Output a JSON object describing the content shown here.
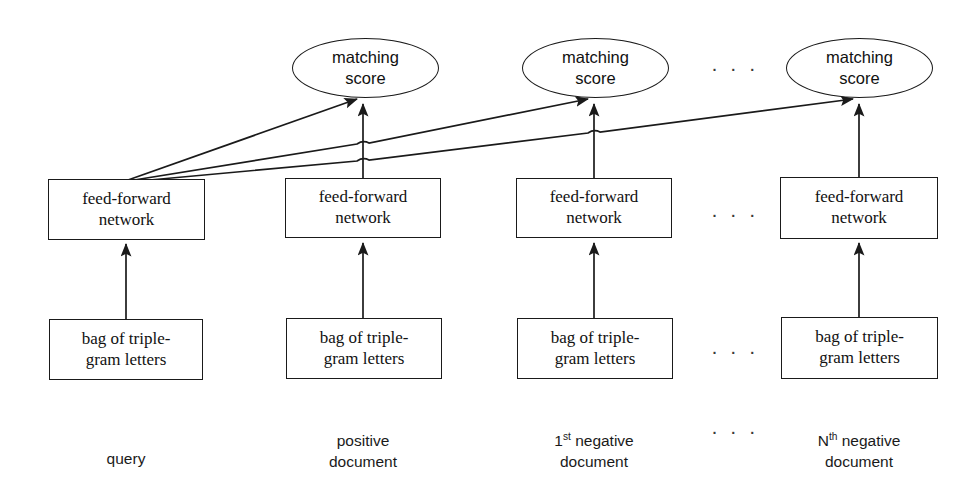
{
  "diagram": {
    "stroke_color": "#1a1a1a",
    "background_color": "#ffffff"
  },
  "score_nodes": [
    {
      "id": "score-query-positive",
      "text": "matching\nscore"
    },
    {
      "id": "score-negative-1",
      "text": "matching\nscore"
    },
    {
      "id": "score-negative-n",
      "text": "matching\nscore"
    }
  ],
  "network_nodes": [
    {
      "id": "ffn-query",
      "text": "feed-forward\nnetwork"
    },
    {
      "id": "ffn-positive",
      "text": "feed-forward\nnetwork"
    },
    {
      "id": "ffn-negative-1",
      "text": "feed-forward\nnetwork"
    },
    {
      "id": "ffn-negative-n",
      "text": "feed-forward\nnetwork"
    }
  ],
  "input_nodes": [
    {
      "id": "bag-query",
      "text": "bag of triple-\ngram letters"
    },
    {
      "id": "bag-positive",
      "text": "bag of triple-\ngram letters"
    },
    {
      "id": "bag-negative-1",
      "text": "bag of triple-\ngram letters"
    },
    {
      "id": "bag-negative-n",
      "text": "bag of triple-\ngram letters"
    }
  ],
  "column_labels": [
    {
      "id": "label-query",
      "text": "query"
    },
    {
      "id": "label-positive",
      "text": "positive\ndocument"
    },
    {
      "id": "label-negative-1",
      "prefix": "1",
      "sup": "st",
      "rest": " negative\ndocument"
    },
    {
      "id": "label-negative-n",
      "prefix": "N",
      "sup": "th",
      "rest": " negative\ndocument"
    }
  ],
  "ellipses_markers": [
    {
      "id": "dots-score-row",
      "text": "· · ·"
    },
    {
      "id": "dots-network-row",
      "text": "· · ·"
    },
    {
      "id": "dots-input-row",
      "text": "· · ·"
    },
    {
      "id": "dots-label-row",
      "text": "· · ·"
    }
  ]
}
